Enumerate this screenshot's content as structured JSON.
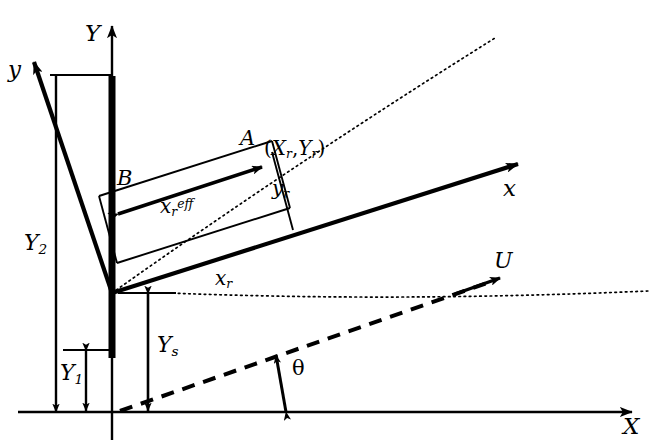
{
  "figure": {
    "kind": "technical-line-diagram",
    "background_color": "#ffffff",
    "line_color": "#000000"
  },
  "axes": {
    "global_x": {
      "label": "X",
      "description": "horizontal global axis arrow pointing right"
    },
    "global_y": {
      "label": "Y",
      "description": "vertical global axis arrow pointing up"
    },
    "local_x": {
      "label": "x",
      "description": "rotated body axis arrow pointing up-right"
    },
    "local_y": {
      "label": "y",
      "description": "rotated body axis arrow pointing up-left"
    }
  },
  "points": {
    "A": {
      "label": "A"
    },
    "B": {
      "label": "B"
    },
    "coordinate": {
      "label_x": "X",
      "label_y": "Y",
      "sub": "r",
      "full": "(Xr,Yr)"
    }
  },
  "dimensions": {
    "y1": {
      "base": "Y",
      "sub": "1"
    },
    "y2": {
      "base": "Y",
      "sub": "2"
    },
    "ys": {
      "base": "Y",
      "sub": "s"
    },
    "yr": {
      "base": "y",
      "sub": "r"
    },
    "xr": {
      "base": "x",
      "sub": "r"
    },
    "xr_eff": {
      "base": "x",
      "sub": "r",
      "sup": "eff"
    }
  },
  "flow": {
    "velocity": {
      "label": "U",
      "description": "free-stream velocity arrow along dashed line"
    },
    "angle": {
      "label": "θ",
      "description": "angle between global X axis and dashed line"
    }
  },
  "elements": {
    "mast": "thick vertical bar along Y axis",
    "dotted_ray": "dotted diagonal ray from origin through (Xr,Yr)",
    "dotted_horizontal": "dotted horizontal reference line at rotated origin",
    "dashed_line": "dashed inclined line carrying U",
    "rectangle": "thin inclined rectangle spanning B to A"
  }
}
